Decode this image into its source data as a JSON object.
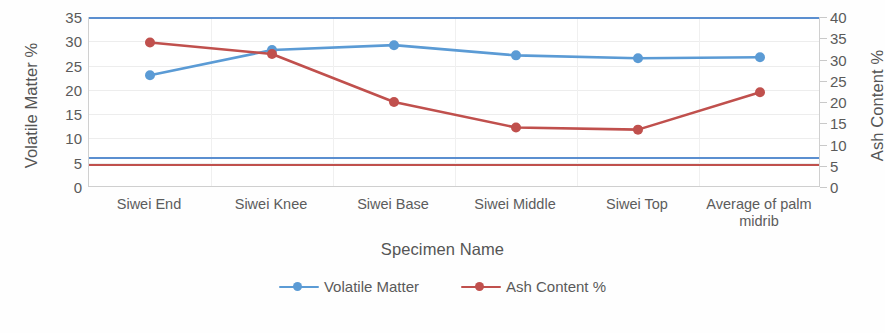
{
  "chart_data": {
    "type": "line",
    "title": "",
    "xlabel": "Specimen Name",
    "ylabel": "Volatile Matter %",
    "y2label": "Ash Content %",
    "categories": [
      "Siwei End",
      "Siwei Knee",
      "Siwei Base",
      "Siwei Middle",
      "Siwei Top",
      "Average of palm midrib"
    ],
    "ylim": [
      0,
      35
    ],
    "y2lim": [
      0,
      40
    ],
    "yticks": [
      0,
      5,
      10,
      15,
      20,
      25,
      30,
      35
    ],
    "y2ticks": [
      0,
      5,
      10,
      15,
      20,
      25,
      30,
      35,
      40
    ],
    "grid": true,
    "legend_position": "bottom",
    "series": [
      {
        "name": "Volatile Matter",
        "axis": "left",
        "color": "#5b9bd5",
        "marker": "circle",
        "values": [
          23.0,
          28.2,
          29.2,
          27.1,
          26.5,
          26.7
        ]
      },
      {
        "name": "Ash Content %",
        "axis": "right",
        "color": "#c0504d",
        "marker": "circle",
        "values": [
          34.0,
          31.3,
          20.0,
          14.0,
          13.5,
          22.3
        ]
      }
    ],
    "stray_reference_lines": [
      {
        "name": "clipped-blue-line",
        "color": "#5b8fd0",
        "y_left_value": 6.1
      },
      {
        "name": "clipped-red-line",
        "color": "#c0504d",
        "y_left_value": 4.7
      }
    ]
  },
  "axes": {
    "left": {
      "title": "Volatile Matter %",
      "ticks": [
        "35",
        "30",
        "25",
        "20",
        "15",
        "10",
        "5",
        "0"
      ]
    },
    "right": {
      "title": "Ash Content %",
      "ticks": [
        "40",
        "35",
        "30",
        "25",
        "20",
        "15",
        "10",
        "5",
        "0"
      ]
    },
    "bottom": {
      "title": "Specimen Name",
      "categories": [
        {
          "line1": "Siwei End",
          "line2": ""
        },
        {
          "line1": "Siwei Knee",
          "line2": ""
        },
        {
          "line1": "Siwei Base",
          "line2": ""
        },
        {
          "line1": "Siwei Middle",
          "line2": ""
        },
        {
          "line1": "Siwei Top",
          "line2": ""
        },
        {
          "line1": "Average of palm",
          "line2": "midrib"
        }
      ]
    }
  },
  "legend": {
    "items": [
      {
        "label": "Volatile Matter",
        "color": "#5b9bd5"
      },
      {
        "label": "Ash Content %",
        "color": "#c0504d"
      }
    ]
  }
}
